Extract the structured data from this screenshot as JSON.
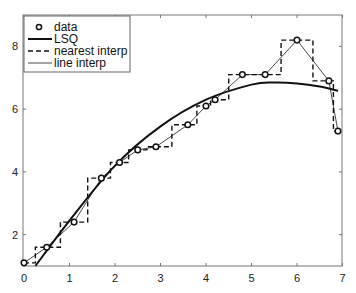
{
  "chart_data": {
    "type": "line",
    "title": "",
    "xlabel": "",
    "ylabel": "",
    "xlim": [
      0,
      7
    ],
    "ylim": [
      1,
      9
    ],
    "x_ticks": [
      0,
      1,
      2,
      3,
      4,
      5,
      6,
      7
    ],
    "x_tick_labels": [
      "0",
      "1",
      "2",
      "3",
      "4",
      "5",
      "6",
      "7"
    ],
    "y_ticks": [
      2,
      4,
      6,
      8
    ],
    "y_tick_labels": [
      "2",
      "4",
      "6",
      "8"
    ],
    "grid": false,
    "legend_position": "upper left",
    "x": [
      0,
      0.5,
      1.1,
      1.7,
      2.1,
      2.5,
      2.9,
      3.6,
      4.0,
      4.2,
      4.8,
      5.3,
      6.0,
      6.7,
      6.9
    ],
    "series": [
      {
        "name": "data",
        "style": "circle markers",
        "values": [
          1.1,
          1.6,
          2.4,
          3.8,
          4.3,
          4.7,
          4.8,
          5.5,
          6.1,
          6.3,
          7.1,
          7.1,
          8.2,
          6.9,
          5.3
        ]
      },
      {
        "name": "LSQ",
        "style": "thick solid",
        "x": [
          0.25,
          1,
          2,
          3,
          4,
          5,
          5.5,
          6,
          6.5,
          6.9
        ],
        "values": [
          1.0,
          2.45,
          4.2,
          5.45,
          6.3,
          6.78,
          6.85,
          6.82,
          6.72,
          6.58
        ]
      },
      {
        "name": "nearest interp",
        "style": "dashed step",
        "values": [
          1.1,
          1.6,
          2.4,
          3.8,
          4.3,
          4.7,
          4.8,
          5.5,
          6.1,
          6.3,
          7.1,
          7.1,
          8.2,
          6.9,
          5.3
        ]
      },
      {
        "name": "line interp",
        "style": "thin solid",
        "values": [
          1.1,
          1.6,
          2.4,
          3.8,
          4.3,
          4.7,
          4.8,
          5.5,
          6.1,
          6.3,
          7.1,
          7.1,
          8.2,
          6.9,
          5.3
        ]
      }
    ]
  },
  "legend": {
    "items": [
      {
        "label": "data"
      },
      {
        "label": "LSQ"
      },
      {
        "label": "nearest interp"
      },
      {
        "label": "line interp"
      }
    ]
  }
}
